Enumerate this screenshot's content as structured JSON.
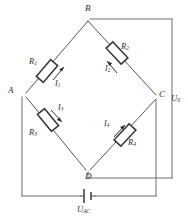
{
  "figure": {
    "kind": "circuit-diagram",
    "name": "Wheatstone bridge circuit",
    "width": 188,
    "height": 220,
    "colors": {
      "background": "#ffffff",
      "wire": "#6e6e6e",
      "arm": "#555555",
      "component_outline": "#3a3a3a",
      "text": "#2b2b2b"
    }
  },
  "nodes": [
    {
      "id": "B",
      "label": "B",
      "x": 88,
      "y": 19,
      "position": "top"
    },
    {
      "id": "A",
      "label": "A",
      "x": 16,
      "y": 93,
      "position": "left"
    },
    {
      "id": "C",
      "label": "C",
      "x": 160,
      "y": 97,
      "position": "right"
    },
    {
      "id": "D",
      "label": "D",
      "x": 88,
      "y": 172,
      "position": "bottom"
    }
  ],
  "resistors": [
    {
      "id": "R1",
      "label": "R",
      "subscript": "1",
      "branch": "A-B",
      "arm": "upper-left"
    },
    {
      "id": "R2",
      "label": "R",
      "subscript": "2",
      "branch": "B-C",
      "arm": "upper-right"
    },
    {
      "id": "R3",
      "label": "R",
      "subscript": "3",
      "branch": "A-D",
      "arm": "lower-left"
    },
    {
      "id": "R4",
      "label": "R",
      "subscript": "4",
      "branch": "D-C",
      "arm": "lower-right"
    }
  ],
  "currents": [
    {
      "id": "I1",
      "label": "I",
      "subscript": "1",
      "branch": "A-B",
      "direction": "toward-B"
    },
    {
      "id": "I2",
      "label": "I",
      "subscript": "2",
      "branch": "B-C",
      "direction": "toward-B"
    },
    {
      "id": "I3",
      "label": "I",
      "subscript": "3",
      "branch": "A-D",
      "direction": "toward-D"
    },
    {
      "id": "I4",
      "label": "I",
      "subscript": "4",
      "branch": "D-C",
      "direction": "toward-C"
    }
  ],
  "sources": [
    {
      "id": "U_AC",
      "label": "U",
      "subscript": "AC",
      "type": "dc-battery",
      "across": "A-C",
      "position": "bottom"
    }
  ],
  "measurements": [
    {
      "id": "U_0",
      "label": "U",
      "subscript": "0",
      "type": "output-voltage",
      "across": "B-D",
      "position": "right"
    }
  ]
}
